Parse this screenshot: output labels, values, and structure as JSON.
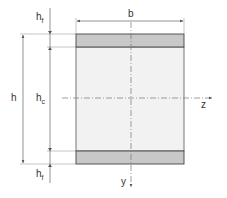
{
  "diagram": {
    "title": "",
    "labels": {
      "b": "b",
      "h": "h",
      "hc_main": "h",
      "hc_sub": "c",
      "hf_top_main": "h",
      "hf_top_sub": "f",
      "hf_bottom_main": "h",
      "hf_bottom_sub": "f",
      "z_axis": "z",
      "y_axis": "y"
    },
    "colors": {
      "flange": "#c8c8c8",
      "core": "#f2f2f2",
      "outline": "#444444",
      "dim_line": "#666666",
      "axis": "#777777"
    },
    "components": [
      {
        "name": "top-face-sheet",
        "label": "h_f"
      },
      {
        "name": "core",
        "label": "h_c"
      },
      {
        "name": "bottom-face-sheet",
        "label": "h_f"
      }
    ]
  }
}
